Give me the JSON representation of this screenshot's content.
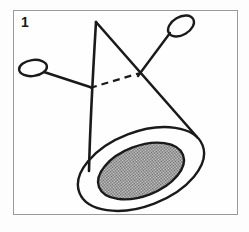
{
  "figure": {
    "panel_label": "1",
    "caption": "",
    "background_color": "#fdfdfd",
    "frame_color": "#9a9a9a",
    "ink_color": "#1a1a1a",
    "shading_color": "#8f8f8f",
    "shading_pattern": "50-percent-checkerboard-dither",
    "frame": {
      "x": 13,
      "y": 10,
      "width": 225,
      "height": 205
    },
    "elements": [
      {
        "name": "cone-apex",
        "type": "point",
        "x": 96,
        "y": 22
      },
      {
        "name": "cone-left-edge",
        "type": "line",
        "from": [
          96,
          22
        ],
        "to": [
          89,
          171
        ]
      },
      {
        "name": "cone-right-edge",
        "type": "line",
        "from": [
          96,
          22
        ],
        "to": [
          197,
          137
        ]
      },
      {
        "name": "outer-ellipse",
        "type": "ellipse",
        "cx": 141,
        "cy": 169,
        "rx": 66,
        "ry": 37,
        "rotation": -21
      },
      {
        "name": "inner-shaded-ellipse",
        "type": "ellipse",
        "cx": 141,
        "cy": 171,
        "rx": 45,
        "ry": 25,
        "rotation": -21
      },
      {
        "name": "left-wire-loop",
        "type": "loop",
        "cx": 33,
        "cy": 68,
        "rx": 14,
        "ry": 8,
        "rotation": -8
      },
      {
        "name": "left-wire-tail",
        "type": "line",
        "from": [
          45,
          73
        ],
        "to": [
          89,
          87
        ]
      },
      {
        "name": "right-wire-loop",
        "type": "loop",
        "cx": 181,
        "cy": 25,
        "rx": 14,
        "ry": 9,
        "rotation": -28
      },
      {
        "name": "right-wire-tail",
        "type": "line",
        "from": [
          170,
          32
        ],
        "to": [
          140,
          73
        ]
      },
      {
        "name": "hidden-dashed-line",
        "type": "dashed-line",
        "from": [
          90,
          88
        ],
        "to": [
          140,
          73
        ]
      }
    ]
  }
}
